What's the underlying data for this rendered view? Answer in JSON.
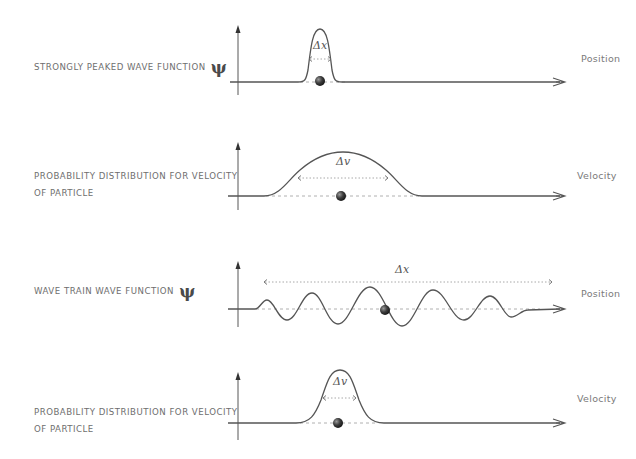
{
  "panels": [
    {
      "caption": "STRONGLY PEAKED WAVE FUNCTION",
      "caption_line2": "",
      "symbol": "ψ",
      "axis_label": "Position",
      "spread_label": "Δx",
      "shape": "narrow-peak"
    },
    {
      "caption": "PROBABILITY DISTRIBUTION FOR VELOCITY",
      "caption_line2": "OF PARTICLE",
      "symbol": "",
      "axis_label": "Velocity",
      "spread_label": "Δv",
      "shape": "wide-bump"
    },
    {
      "caption": "WAVE TRAIN WAVE FUNCTION",
      "caption_line2": "",
      "symbol": "ψ",
      "axis_label": "Position",
      "spread_label": "Δx",
      "shape": "wave-train"
    },
    {
      "caption": "PROBABILITY DISTRIBUTION FOR VELOCITY",
      "caption_line2": "OF PARTICLE",
      "symbol": "",
      "axis_label": "Velocity",
      "spread_label": "Δv",
      "shape": "narrow-peak"
    }
  ],
  "colors": {
    "curve": "#555555",
    "axis": "#444444",
    "dashed": "#b0b0b0",
    "caption": "#6e6e6e",
    "particle": "#3a3a3a"
  }
}
